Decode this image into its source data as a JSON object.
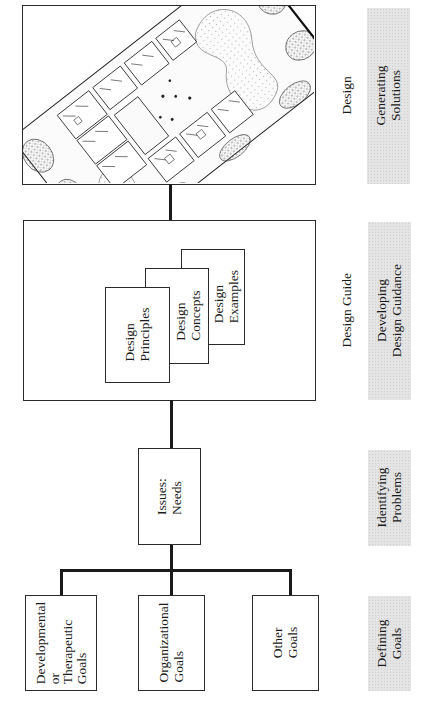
{
  "diagram": {
    "stages": [
      {
        "id": "defining-goals",
        "label": "Defining\nGoals"
      },
      {
        "id": "identifying-problems",
        "label": "Identifying\nProblems"
      },
      {
        "id": "developing-design-guidance",
        "label": "Developing\nDesign Guidance"
      },
      {
        "id": "generating-solutions",
        "label": "Generating\nSolutions"
      }
    ],
    "goals": [
      {
        "label": "Developmental\nor\nTherapeutic\nGoals"
      },
      {
        "label": "Organizational\nGoals"
      },
      {
        "label": "Other\nGoals"
      }
    ],
    "issues": {
      "label": "Issues:\nNeeds"
    },
    "design_guide": {
      "caption": "Design Guide",
      "cards": [
        {
          "label": "Design\nPrinciples"
        },
        {
          "label": "Design\nConcepts"
        },
        {
          "label": "Design\nExamples"
        }
      ]
    },
    "design": {
      "caption": "Design",
      "illustration": "isometric-site-plan-illustration"
    },
    "orientation": "rotated-90-ccw",
    "colors": {
      "line": "#1a1a1a",
      "stage_band": "#e4e4e4",
      "background": "#ffffff"
    }
  }
}
